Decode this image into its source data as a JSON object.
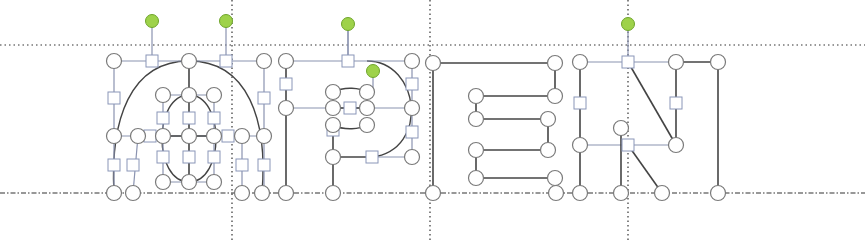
{
  "diagram": {
    "word": "OPEN",
    "letters": [
      "O",
      "P",
      "E",
      "N"
    ],
    "colors": {
      "background": "#ffffff",
      "guide": "#333333",
      "stroke_dark": "#444444",
      "stroke_light": "#8a93b0",
      "node_fill": "#ffffff",
      "node_stroke": "#7a7a7a",
      "square_stroke": "#8a96b8",
      "rotate_handle": "#9ed24a",
      "rotate_handle_stroke": "#6fa52b"
    },
    "guides": {
      "top_y": 45,
      "baseline_y": 193,
      "vertical_x": [
        232,
        430,
        628
      ]
    },
    "rotate_handles": [
      {
        "x": 152,
        "y": 21,
        "stem_to": 61
      },
      {
        "x": 226,
        "y": 21,
        "stem_to": 61
      },
      {
        "x": 348,
        "y": 24,
        "stem_to": 61
      },
      {
        "x": 373,
        "y": 71,
        "stem_to": 88
      },
      {
        "x": 628,
        "y": 24,
        "stem_to": 62
      }
    ],
    "lines": [
      {
        "x1": 114,
        "y1": 61,
        "x2": 264,
        "y2": 61,
        "c": "light"
      },
      {
        "x1": 114,
        "y1": 61,
        "x2": 114,
        "y2": 193,
        "c": "light"
      },
      {
        "x1": 264,
        "y1": 61,
        "x2": 264,
        "y2": 193,
        "c": "light"
      },
      {
        "x1": 189,
        "y1": 61,
        "x2": 189,
        "y2": 95,
        "c": "dark"
      },
      {
        "x1": 114,
        "y1": 136,
        "x2": 264,
        "y2": 136,
        "c": "light"
      },
      {
        "x1": 163,
        "y1": 136,
        "x2": 214,
        "y2": 136,
        "c": "dark"
      },
      {
        "x1": 163,
        "y1": 95,
        "x2": 214,
        "y2": 95,
        "c": "light"
      },
      {
        "x1": 163,
        "y1": 182,
        "x2": 214,
        "y2": 182,
        "c": "light"
      },
      {
        "x1": 163,
        "y1": 95,
        "x2": 163,
        "y2": 182,
        "c": "light"
      },
      {
        "x1": 189,
        "y1": 95,
        "x2": 189,
        "y2": 182,
        "c": "dark"
      },
      {
        "x1": 214,
        "y1": 95,
        "x2": 214,
        "y2": 182,
        "c": "light"
      },
      {
        "x1": 138,
        "y1": 136,
        "x2": 133,
        "y2": 193,
        "c": "light"
      },
      {
        "x1": 242,
        "y1": 136,
        "x2": 242,
        "y2": 193,
        "c": "light"
      },
      {
        "x1": 286,
        "y1": 61,
        "x2": 412,
        "y2": 61,
        "c": "light"
      },
      {
        "x1": 286,
        "y1": 61,
        "x2": 286,
        "y2": 193,
        "c": "dark"
      },
      {
        "x1": 412,
        "y1": 61,
        "x2": 412,
        "y2": 157,
        "c": "light"
      },
      {
        "x1": 286,
        "y1": 108,
        "x2": 412,
        "y2": 108,
        "c": "light"
      },
      {
        "x1": 333,
        "y1": 108,
        "x2": 367,
        "y2": 108,
        "c": "dark"
      },
      {
        "x1": 333,
        "y1": 157,
        "x2": 372,
        "y2": 157,
        "c": "dark"
      },
      {
        "x1": 372,
        "y1": 157,
        "x2": 412,
        "y2": 157,
        "c": "light"
      },
      {
        "x1": 333,
        "y1": 125,
        "x2": 333,
        "y2": 193,
        "c": "dark"
      },
      {
        "x1": 348,
        "y1": 61,
        "x2": 348,
        "y2": 24,
        "c": "light"
      },
      {
        "x1": 433,
        "y1": 63,
        "x2": 555,
        "y2": 63,
        "c": "dark"
      },
      {
        "x1": 433,
        "y1": 63,
        "x2": 433,
        "y2": 193,
        "c": "dark"
      },
      {
        "x1": 555,
        "y1": 63,
        "x2": 555,
        "y2": 96,
        "c": "dark"
      },
      {
        "x1": 476,
        "y1": 96,
        "x2": 555,
        "y2": 96,
        "c": "dark"
      },
      {
        "x1": 476,
        "y1": 96,
        "x2": 476,
        "y2": 119,
        "c": "dark"
      },
      {
        "x1": 476,
        "y1": 119,
        "x2": 548,
        "y2": 119,
        "c": "dark"
      },
      {
        "x1": 548,
        "y1": 119,
        "x2": 548,
        "y2": 150,
        "c": "dark"
      },
      {
        "x1": 476,
        "y1": 150,
        "x2": 548,
        "y2": 150,
        "c": "dark"
      },
      {
        "x1": 476,
        "y1": 150,
        "x2": 476,
        "y2": 178,
        "c": "dark"
      },
      {
        "x1": 476,
        "y1": 178,
        "x2": 555,
        "y2": 178,
        "c": "dark"
      },
      {
        "x1": 580,
        "y1": 62,
        "x2": 676,
        "y2": 62,
        "c": "light"
      },
      {
        "x1": 676,
        "y1": 62,
        "x2": 718,
        "y2": 62,
        "c": "dark"
      },
      {
        "x1": 580,
        "y1": 62,
        "x2": 580,
        "y2": 193,
        "c": "dark"
      },
      {
        "x1": 676,
        "y1": 62,
        "x2": 676,
        "y2": 145,
        "c": "dark"
      },
      {
        "x1": 718,
        "y1": 62,
        "x2": 718,
        "y2": 193,
        "c": "dark"
      },
      {
        "x1": 580,
        "y1": 145,
        "x2": 676,
        "y2": 145,
        "c": "light"
      },
      {
        "x1": 628,
        "y1": 62,
        "x2": 676,
        "y2": 145,
        "c": "dark"
      },
      {
        "x1": 628,
        "y1": 145,
        "x2": 662,
        "y2": 193,
        "c": "dark"
      },
      {
        "x1": 621,
        "y1": 128,
        "x2": 621,
        "y2": 193,
        "c": "dark"
      }
    ],
    "curves": [
      {
        "d": "M 114 193 C 110 120, 130 61, 189 61 C 248 61, 268 120, 262 193",
        "c": "dark"
      },
      {
        "d": "M 189 95 C 225 95, 225 182, 189 182 C 153 182, 153 95, 189 95",
        "c": "dark"
      },
      {
        "d": "M 367 61 C 420 61, 430 150, 372 157",
        "c": "dark"
      },
      {
        "d": "M 333 92 C 345 86, 360 88, 367 92 M 333 125 C 345 131, 360 129, 367 125",
        "c": "dark"
      }
    ],
    "circles": [
      {
        "x": 114,
        "y": 61
      },
      {
        "x": 189,
        "y": 61
      },
      {
        "x": 264,
        "y": 61
      },
      {
        "x": 114,
        "y": 136
      },
      {
        "x": 138,
        "y": 136
      },
      {
        "x": 163,
        "y": 136
      },
      {
        "x": 189,
        "y": 136
      },
      {
        "x": 214,
        "y": 136
      },
      {
        "x": 242,
        "y": 136
      },
      {
        "x": 264,
        "y": 136
      },
      {
        "x": 163,
        "y": 95
      },
      {
        "x": 189,
        "y": 95
      },
      {
        "x": 214,
        "y": 95
      },
      {
        "x": 163,
        "y": 182
      },
      {
        "x": 189,
        "y": 182
      },
      {
        "x": 214,
        "y": 182
      },
      {
        "x": 114,
        "y": 193
      },
      {
        "x": 133,
        "y": 193
      },
      {
        "x": 242,
        "y": 193
      },
      {
        "x": 262,
        "y": 193
      },
      {
        "x": 286,
        "y": 61
      },
      {
        "x": 412,
        "y": 61
      },
      {
        "x": 286,
        "y": 108
      },
      {
        "x": 333,
        "y": 108
      },
      {
        "x": 367,
        "y": 108
      },
      {
        "x": 412,
        "y": 108
      },
      {
        "x": 333,
        "y": 92
      },
      {
        "x": 367,
        "y": 92
      },
      {
        "x": 333,
        "y": 125
      },
      {
        "x": 367,
        "y": 125
      },
      {
        "x": 333,
        "y": 157
      },
      {
        "x": 412,
        "y": 157
      },
      {
        "x": 286,
        "y": 193
      },
      {
        "x": 333,
        "y": 193
      },
      {
        "x": 433,
        "y": 63
      },
      {
        "x": 555,
        "y": 63
      },
      {
        "x": 476,
        "y": 96
      },
      {
        "x": 555,
        "y": 96
      },
      {
        "x": 476,
        "y": 119
      },
      {
        "x": 548,
        "y": 119
      },
      {
        "x": 476,
        "y": 150
      },
      {
        "x": 548,
        "y": 150
      },
      {
        "x": 476,
        "y": 178
      },
      {
        "x": 555,
        "y": 178
      },
      {
        "x": 433,
        "y": 193
      },
      {
        "x": 556,
        "y": 193
      },
      {
        "x": 580,
        "y": 62
      },
      {
        "x": 676,
        "y": 62
      },
      {
        "x": 718,
        "y": 62
      },
      {
        "x": 580,
        "y": 145
      },
      {
        "x": 676,
        "y": 145
      },
      {
        "x": 621,
        "y": 128
      },
      {
        "x": 580,
        "y": 193
      },
      {
        "x": 621,
        "y": 193
      },
      {
        "x": 662,
        "y": 193
      },
      {
        "x": 718,
        "y": 193
      }
    ],
    "squares": [
      {
        "x": 152,
        "y": 61
      },
      {
        "x": 226,
        "y": 61
      },
      {
        "x": 114,
        "y": 98
      },
      {
        "x": 264,
        "y": 98
      },
      {
        "x": 163,
        "y": 118
      },
      {
        "x": 189,
        "y": 118
      },
      {
        "x": 214,
        "y": 118
      },
      {
        "x": 163,
        "y": 157
      },
      {
        "x": 189,
        "y": 157
      },
      {
        "x": 214,
        "y": 157
      },
      {
        "x": 150,
        "y": 136
      },
      {
        "x": 228,
        "y": 136
      },
      {
        "x": 114,
        "y": 165
      },
      {
        "x": 133,
        "y": 165
      },
      {
        "x": 242,
        "y": 165
      },
      {
        "x": 264,
        "y": 165
      },
      {
        "x": 348,
        "y": 61
      },
      {
        "x": 286,
        "y": 84
      },
      {
        "x": 412,
        "y": 84
      },
      {
        "x": 350,
        "y": 108
      },
      {
        "x": 412,
        "y": 132
      },
      {
        "x": 372,
        "y": 157
      },
      {
        "x": 333,
        "y": 130
      },
      {
        "x": 628,
        "y": 62
      },
      {
        "x": 580,
        "y": 103
      },
      {
        "x": 676,
        "y": 103
      },
      {
        "x": 628,
        "y": 145
      }
    ]
  }
}
